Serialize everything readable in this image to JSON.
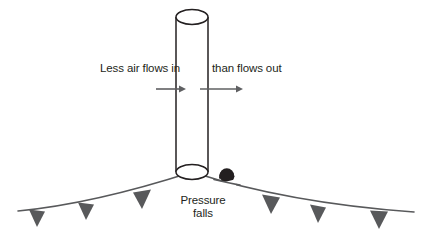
{
  "diagram": {
    "labels": {
      "inflow": "Less air flows in",
      "outflow": "than flows out",
      "pressure_line1": "Pressure",
      "pressure_line2": "falls"
    },
    "colors": {
      "background": "#ffffff",
      "outline": "#231f20",
      "text": "#231f20",
      "arrow": "#5f6062",
      "surface_line": "#58595b",
      "triangle_fill": "#58595b",
      "blob_fill": "#231f20"
    },
    "cylinder": {
      "name": "air-column",
      "left_x": 176,
      "right_x": 208,
      "top_y": 17,
      "bottom_y": 172,
      "ellipse_ry": 7.5
    },
    "arrows": [
      {
        "name": "inflow-arrow",
        "x1": 156,
        "x2": 186,
        "y": 89,
        "label_ref": "inflow"
      },
      {
        "name": "outflow-arrow",
        "x1": 200,
        "x2": 243,
        "y": 89,
        "label_ref": "outflow"
      }
    ],
    "surface": {
      "name": "surface-pressure-curve",
      "peak_x": 192,
      "peak_y": 172,
      "left_end_x": 18,
      "left_end_y": 211,
      "right_end_x": 414,
      "right_end_y": 212
    },
    "triangles": [
      {
        "name": "surface-marker-1",
        "apex_x": 37,
        "top_y": 210,
        "half_width": 8,
        "height": 17
      },
      {
        "name": "surface-marker-2",
        "apex_x": 86,
        "top_y": 203,
        "half_width": 8,
        "height": 17
      },
      {
        "name": "surface-marker-3",
        "apex_x": 142,
        "top_y": 191,
        "half_width": 9,
        "height": 18
      },
      {
        "name": "surface-marker-4",
        "apex_x": 271,
        "top_y": 196,
        "half_width": 9,
        "height": 18
      },
      {
        "name": "surface-marker-5",
        "apex_x": 318,
        "top_y": 206,
        "half_width": 8,
        "height": 17
      },
      {
        "name": "surface-marker-6",
        "apex_x": 379,
        "top_y": 212,
        "half_width": 9,
        "height": 17
      }
    ],
    "blob": {
      "name": "low-pressure-blob",
      "cx": 227,
      "cy": 175,
      "rx": 7,
      "ry": 7
    }
  }
}
